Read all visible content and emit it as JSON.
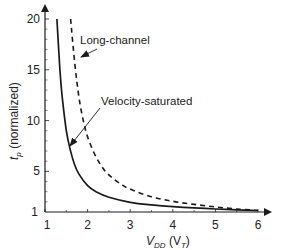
{
  "chart_data": {
    "type": "line",
    "title": "",
    "xlabel": "V_DD (V_T)",
    "ylabel": "t_p (normalized)",
    "xlim": [
      1,
      6.3
    ],
    "ylim": [
      1,
      21
    ],
    "x_ticks": [
      1,
      2,
      3,
      4,
      5,
      6
    ],
    "y_ticks": [
      1,
      5,
      10,
      15,
      20
    ],
    "y_tick_labels": [
      "1",
      "5",
      "10",
      "15",
      "20"
    ],
    "grid": false,
    "legend": "none (inline annotations with arrows)",
    "series": [
      {
        "name": "Long-channel",
        "style": "dashed",
        "x": [
          1.6,
          1.7,
          1.8,
          1.9,
          2.0,
          2.2,
          2.4,
          2.6,
          2.8,
          3.0,
          3.5,
          4.0,
          4.5,
          5.0,
          5.5,
          6.0
        ],
        "y": [
          20.0,
          15.6,
          12.2,
          10.0,
          8.4,
          6.4,
          5.1,
          4.3,
          3.7,
          3.25,
          2.5,
          2.05,
          1.75,
          1.5,
          1.3,
          1.15
        ]
      },
      {
        "name": "Velocity-saturated",
        "style": "solid",
        "x": [
          1.28,
          1.35,
          1.4,
          1.5,
          1.6,
          1.7,
          1.8,
          2.0,
          2.2,
          2.5,
          3.0,
          3.5,
          4.0,
          4.5,
          5.0,
          5.5,
          6.0
        ],
        "y": [
          20.0,
          15.0,
          12.5,
          9.0,
          7.0,
          5.6,
          4.7,
          3.6,
          3.0,
          2.45,
          1.95,
          1.7,
          1.52,
          1.4,
          1.3,
          1.22,
          1.15
        ]
      }
    ],
    "annotations": [
      {
        "text": "Long-channel",
        "points_to": "Long-channel"
      },
      {
        "text": "Velocity-saturated",
        "points_to": "Velocity-saturated"
      }
    ]
  },
  "labels": {
    "ylabel_main": "t",
    "ylabel_sub": "p",
    "ylabel_rest": " (normalized)",
    "xlabel_main": "V",
    "xlabel_sub": "DD",
    "xlabel_paren_open": " (V",
    "xlabel_paren_sub": "T",
    "xlabel_paren_close": ")",
    "origin_y": "1",
    "annotation_long": "Long-channel",
    "annotation_vel": "Velocity-saturated"
  },
  "colors": {
    "ink": "#1a1a1a",
    "background": "#ffffff"
  }
}
